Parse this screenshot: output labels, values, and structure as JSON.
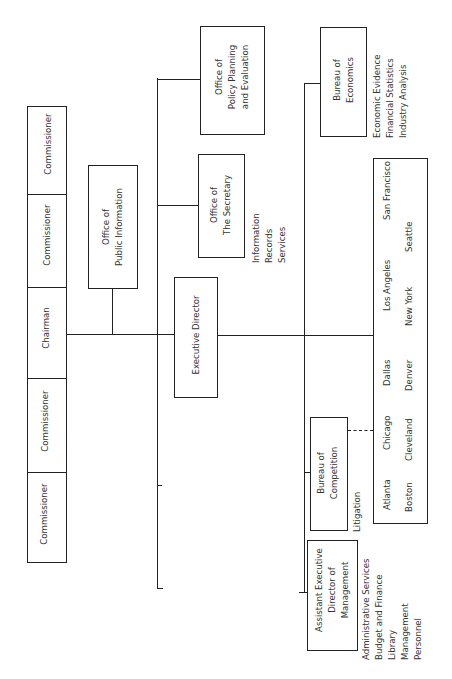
{
  "chart_title": "",
  "board": {
    "members": [
      {
        "label": "Commissioner"
      },
      {
        "label": "Commissioner"
      },
      {
        "label": "Chairman"
      },
      {
        "label": "Commissioner"
      },
      {
        "label": "Commissioner"
      }
    ]
  },
  "offices": {
    "public_information": {
      "label": "Office of\nPublic Information"
    },
    "executive_director": {
      "label": "Executive Director"
    },
    "secretary": {
      "label": "Office of\nThe Secretary",
      "functions": "Information\nRecords\nServices"
    },
    "policy_planning": {
      "label": "Office of\nPolicy Planning\nand Evaluation"
    },
    "bureau_economics": {
      "label": "Bureau of\nEconomics",
      "functions": "Economic Evidence\nFinancial Statistics\nIndustry Analysis"
    },
    "bureau_competition": {
      "label": "Bureau of\nCompetition",
      "functions": "Litigation"
    },
    "assistant_executive_director": {
      "label": "Assistant Executive\nDirector of\nManagement",
      "functions": "Administrative Services\nBudget and Finance\nLibrary\nManagement\nPersonnel"
    }
  },
  "regional_offices": {
    "row1": [
      "Atlanta",
      "Chicago",
      "Dallas",
      "Los Angeles",
      "San Francisco"
    ],
    "row2": [
      "Boston",
      "Cleveland",
      "Denver",
      "New York",
      "Seattle"
    ]
  }
}
